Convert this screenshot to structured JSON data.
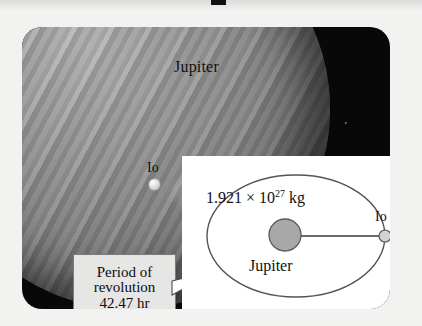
{
  "figure": {
    "type": "astronomy-illustration",
    "photo": {
      "planet_label": "Jupiter",
      "moon_label": "Io"
    },
    "callout": {
      "line1": "Period of",
      "line2": "revolution",
      "line3": "42.47 hr",
      "period_value": "42.47",
      "period_unit": "hr"
    },
    "inset": {
      "mass_mantissa": "1.921 × 10",
      "mass_exponent": "27",
      "mass_unit": " kg",
      "mass_full": "1.921 × 10^27 kg",
      "planet_label": "Jupiter",
      "moon_label": "Io"
    },
    "colors": {
      "frame": "#080808",
      "inset_background": "#ffffff",
      "callout_background": "#e6e6e4",
      "planet_gray": "#a8a8a8",
      "moon_gray": "#cfcfcf",
      "stroke": "#555555",
      "page_background": "#f2f2f0"
    }
  }
}
